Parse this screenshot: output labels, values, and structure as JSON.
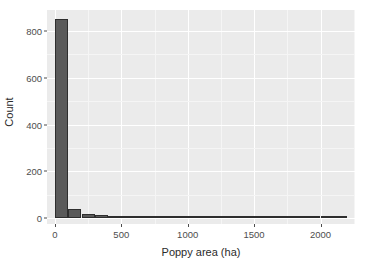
{
  "chart_data": {
    "type": "bar",
    "subtype": "histogram",
    "title": "",
    "xlabel": "Poppy area (ha)",
    "ylabel": "Count",
    "xlim": [
      -60,
      2260
    ],
    "ylim": [
      -25,
      890
    ],
    "x_ticks": [
      0,
      500,
      1000,
      1500,
      2000
    ],
    "x_tick_labels": [
      "0",
      "500",
      "1000",
      "1500",
      "2000"
    ],
    "y_ticks": [
      0,
      200,
      400,
      600,
      800
    ],
    "y_tick_labels": [
      "0",
      "200",
      "400",
      "600",
      "800"
    ],
    "bin_width": 100,
    "bin_starts": [
      0,
      100,
      200,
      300,
      400,
      500,
      600,
      700,
      800,
      900,
      1000,
      1100,
      1200,
      1300,
      1400,
      1500,
      1600,
      1700,
      1800,
      1900,
      2000,
      2100
    ],
    "values": [
      850,
      40,
      17,
      15,
      8,
      7,
      4,
      2,
      2,
      2,
      1,
      1,
      1,
      1,
      1,
      1,
      1,
      1,
      1,
      1,
      1,
      1
    ],
    "categories": [
      "0-100",
      "100-200",
      "200-300",
      "300-400",
      "400-500",
      "500-600",
      "600-700",
      "700-800",
      "800-900",
      "900-1000",
      "1000-1100",
      "1100-1200",
      "1200-1300",
      "1300-1400",
      "1400-1500",
      "1500-1600",
      "1600-1700",
      "1700-1800",
      "1800-1900",
      "1900-2000",
      "2000-2100",
      "2100-2200"
    ],
    "grid": true,
    "legend": "none",
    "colors": {
      "panel_background": "#ebebeb",
      "grid_major": "#ffffff",
      "grid_minor": "#f5f5f5",
      "bar_fill": "#5a5a5a",
      "bar_outline": "#2e2e2e",
      "axis_text": "#4d4d4d",
      "axis_title": "#2b2b2b",
      "figure_background": "#ffffff"
    }
  }
}
